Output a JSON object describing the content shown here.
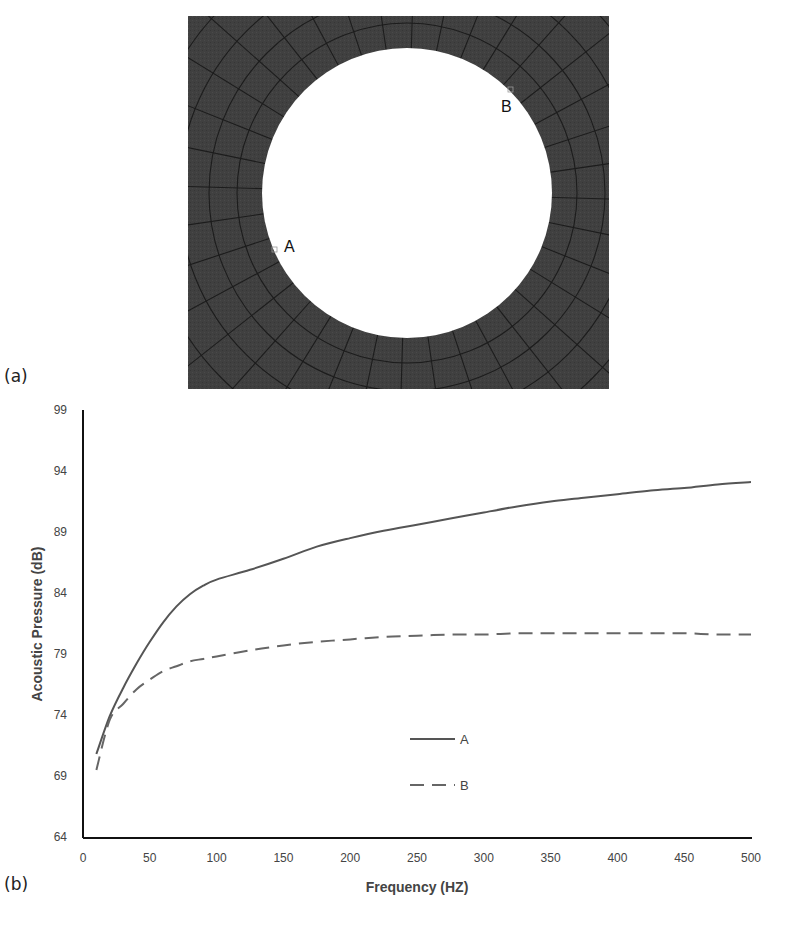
{
  "figure": {
    "panel_a_label": "(a)",
    "panel_b_label": "(b)",
    "mesh": {
      "description": "Finite-element mesh around circular hole",
      "fill_color": "#3f3f3f",
      "line_color": "#1a1a1a",
      "hole_color": "#ffffff",
      "point_a_label": "A",
      "point_b_label": "B"
    }
  },
  "chart_data": {
    "type": "line",
    "title": "",
    "xlabel": "Frequency (HZ)",
    "ylabel": "Acoustic Pressure (dB)",
    "xlim": [
      0,
      500
    ],
    "ylim": [
      64,
      99
    ],
    "x_ticks": [
      0,
      50,
      100,
      150,
      200,
      250,
      300,
      350,
      400,
      450,
      500
    ],
    "y_ticks": [
      64,
      69,
      74,
      79,
      84,
      89,
      94,
      99
    ],
    "grid": false,
    "legend_position": "inside-center-bottom",
    "x": [
      10,
      20,
      30,
      40,
      50,
      60,
      70,
      80,
      90,
      100,
      125,
      150,
      175,
      200,
      225,
      250,
      275,
      300,
      325,
      350,
      375,
      400,
      425,
      450,
      475,
      500
    ],
    "series": [
      {
        "name": "A",
        "style": "solid",
        "color": "#555555",
        "values": [
          70.8,
          73.9,
          76.2,
          78.2,
          80.0,
          81.6,
          82.9,
          83.9,
          84.6,
          85.1,
          85.9,
          86.8,
          87.8,
          88.5,
          89.1,
          89.6,
          90.1,
          90.6,
          91.1,
          91.5,
          91.8,
          92.1,
          92.4,
          92.6,
          92.9,
          93.1
        ]
      },
      {
        "name": "B",
        "style": "dashed",
        "color": "#666666",
        "values": [
          69.5,
          73.6,
          74.9,
          76.1,
          76.9,
          77.6,
          78.0,
          78.4,
          78.6,
          78.8,
          79.3,
          79.7,
          80.0,
          80.2,
          80.4,
          80.5,
          80.6,
          80.6,
          80.7,
          80.7,
          80.7,
          80.7,
          80.7,
          80.7,
          80.6,
          80.6
        ]
      }
    ]
  }
}
